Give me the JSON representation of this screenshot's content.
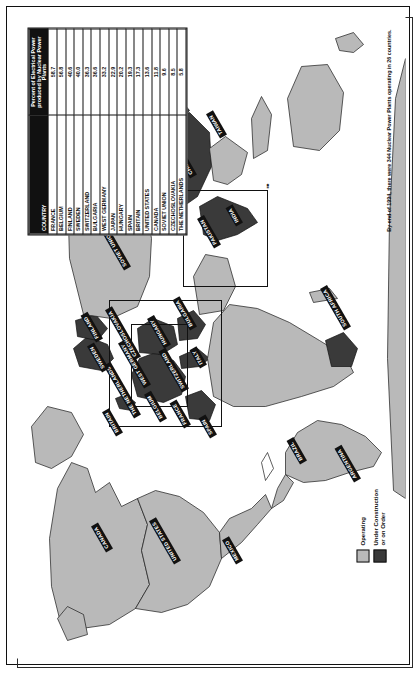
{
  "poster": {
    "footnote": "By end of 1994, there were 344 Nuclear Power Plants operating in 26 countries.",
    "compass_icon": "north-arrow-icon"
  },
  "legend": {
    "items": [
      {
        "label": "Operating",
        "color": "#b9b9b9",
        "icon": "legend-swatch-operating"
      },
      {
        "label": "Under Construction\nor on Order",
        "color": "#3a3a3a",
        "icon": "legend-swatch-under-construction"
      }
    ]
  },
  "table": {
    "header_country": "COUNTRY",
    "header_percent": "Percent of Electrical Power produced by Nuclear Power Plants",
    "rows": [
      {
        "country": "FRANCE",
        "percent": "58.7"
      },
      {
        "country": "BELGIUM",
        "percent": "56.8"
      },
      {
        "country": "FINLAND",
        "percent": "40.6"
      },
      {
        "country": "SWEDEN",
        "percent": "40.0"
      },
      {
        "country": "SWITZERLAND",
        "percent": "36.3"
      },
      {
        "country": "BULGARIA",
        "percent": "36.6"
      },
      {
        "country": "WEST GERMANY",
        "percent": "33.2"
      },
      {
        "country": "JAPAN",
        "percent": "22.9"
      },
      {
        "country": "HUNGARY",
        "percent": "20.2"
      },
      {
        "country": "SPAIN",
        "percent": "19.3"
      },
      {
        "country": "BRITAIN",
        "percent": "17.3"
      },
      {
        "country": "UNITED STATES",
        "percent": "13.6"
      },
      {
        "country": "CANADA",
        "percent": "11.8"
      },
      {
        "country": "SOVIET UNION",
        "percent": "9.6"
      },
      {
        "country": "CZECHOSLOVAKIA",
        "percent": "8.5"
      },
      {
        "country": "THE NETHERLANDS",
        "percent": "5.8"
      }
    ]
  },
  "map": {
    "labels": [
      {
        "name": "CANADA",
        "x": 108,
        "y": 92,
        "rot": -30
      },
      {
        "name": "UNITED STATES",
        "x": 96,
        "y": 160,
        "rot": -30
      },
      {
        "name": "MEXICO",
        "x": 96,
        "y": 222,
        "rot": -30
      },
      {
        "name": "BRAZIL",
        "x": 196,
        "y": 286,
        "rot": -30
      },
      {
        "name": "ARGENTINA",
        "x": 178,
        "y": 340,
        "rot": -30
      },
      {
        "name": "BRITAIN",
        "x": 224,
        "y": 102,
        "rot": -30
      },
      {
        "name": "THE NETHERLANDS",
        "x": 242,
        "y": 120,
        "rot": -30
      },
      {
        "name": "BELGIUM",
        "x": 238,
        "y": 146,
        "rot": -30
      },
      {
        "name": "FRANCE",
        "x": 232,
        "y": 170,
        "rot": -30
      },
      {
        "name": "SPAIN",
        "x": 222,
        "y": 196,
        "rot": -30
      },
      {
        "name": "SWEDEN",
        "x": 288,
        "y": 88,
        "rot": -30
      },
      {
        "name": "FINLAND",
        "x": 318,
        "y": 82,
        "rot": -30
      },
      {
        "name": "WEST GERMANY",
        "x": 272,
        "y": 130,
        "rot": -30
      },
      {
        "name": "SWITZERLAND",
        "x": 268,
        "y": 168,
        "rot": -30
      },
      {
        "name": "ITALY",
        "x": 292,
        "y": 186,
        "rot": -30
      },
      {
        "name": "CZECHOSLOVAKIA",
        "x": 300,
        "y": 120,
        "rot": -30
      },
      {
        "name": "HUNGARY",
        "x": 312,
        "y": 150,
        "rot": -30
      },
      {
        "name": "BULGARIA",
        "x": 330,
        "y": 176,
        "rot": -30
      },
      {
        "name": "SOVIET UNION",
        "x": 390,
        "y": 110,
        "rot": -30
      },
      {
        "name": "INDIA",
        "x": 434,
        "y": 222,
        "rot": -30
      },
      {
        "name": "PAKISTAN",
        "x": 412,
        "y": 200,
        "rot": -30
      },
      {
        "name": "CHINA",
        "x": 482,
        "y": 176,
        "rot": -30
      },
      {
        "name": "SOUTH KOREA",
        "x": 520,
        "y": 162,
        "rot": -30
      },
      {
        "name": "JAPAN",
        "x": 548,
        "y": 132,
        "rot": -30
      },
      {
        "name": "TAIWAN",
        "x": 522,
        "y": 206,
        "rot": -30
      },
      {
        "name": "SOUTH AFRICA",
        "x": 330,
        "y": 330,
        "rot": -30
      }
    ]
  }
}
